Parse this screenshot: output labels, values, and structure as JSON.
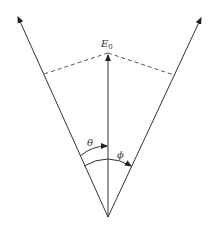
{
  "diagram": {
    "labels": {
      "field": "E",
      "field_subscript": "0",
      "theta": "θ",
      "phi": "ϕ"
    },
    "colors": {
      "line": "#333333",
      "dashed": "#555555",
      "background": "#ffffff"
    },
    "geometry": {
      "origin": [
        108,
        217
      ],
      "left_axis_tip": [
        17,
        15
      ],
      "right_axis_tip": [
        202,
        16
      ],
      "center_vector_tip": [
        108,
        53
      ],
      "left_projection_point": [
        44,
        74
      ],
      "right_projection_point": [
        174,
        75
      ]
    }
  }
}
